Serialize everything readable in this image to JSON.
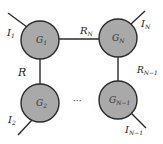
{
  "diagram": {
    "type": "circuit-network-ring",
    "colors": {
      "node_fill": "#a9a9a9",
      "stroke": "#2a2a2a",
      "background": "#ffffff"
    },
    "nodes": [
      {
        "id": "g1",
        "symbol": "G",
        "subscript": "1",
        "cx": 40,
        "cy": 40,
        "r": 19
      },
      {
        "id": "gN",
        "symbol": "G",
        "subscript": "N",
        "cx": 118,
        "cy": 38,
        "r": 19
      },
      {
        "id": "g2",
        "symbol": "G",
        "subscript": "2",
        "cx": 40,
        "cy": 103,
        "r": 19
      },
      {
        "id": "gN-1",
        "symbol": "G",
        "subscript": "N−1",
        "cx": 118,
        "cy": 100,
        "r": 19
      }
    ],
    "edges": [
      {
        "from": "g1",
        "to": "gN",
        "label_main": "R",
        "label_sub": "N"
      },
      {
        "from": "g1",
        "to": "g2",
        "label_main": "R",
        "label_sub": ""
      },
      {
        "from": "gN",
        "to": "gN-1",
        "label_main": "R",
        "label_sub": "N−1"
      },
      {
        "from": "g2",
        "to": "gN-1",
        "label_main": "···",
        "label_sub": "",
        "dashed_ellipsis": true
      }
    ],
    "currents": [
      {
        "node": "g1",
        "label_main": "I",
        "label_sub": "1"
      },
      {
        "node": "gN",
        "label_main": "I",
        "label_sub": "N"
      },
      {
        "node": "g2",
        "label_main": "I",
        "label_sub": "2"
      },
      {
        "node": "gN-1",
        "label_main": "I",
        "label_sub": "N−1"
      }
    ],
    "ellipsis": "···"
  }
}
